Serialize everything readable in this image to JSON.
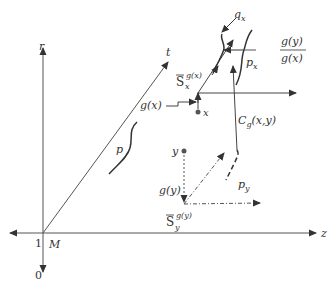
{
  "diagram": {
    "axes": {
      "r_label": "r",
      "t_label": "t",
      "z_label": "z",
      "origin_label": "M",
      "origin_value": "1",
      "down_value": "0"
    },
    "labels": {
      "q_x": "q",
      "q_x_sub": "x",
      "p_x": "p",
      "p_x_sub": "x",
      "ratio_num": "g(y)",
      "ratio_den": "g(x)",
      "S_x": "S",
      "S_x_sub": "x",
      "S_x_sup": "g(x)",
      "g_x": "g(x)",
      "x_point": "x",
      "C_g": "C",
      "C_g_sub": "g",
      "C_g_args": "(x,y)",
      "p": "p",
      "y_point": "y",
      "g_y": "g(y)",
      "p_y": "p",
      "p_y_sub": "y",
      "S_y": "S",
      "S_y_sub": "y",
      "S_y_sup": "g(y)"
    },
    "colors": {
      "line": "#444444",
      "text": "#333333",
      "background": "#ffffff"
    }
  }
}
